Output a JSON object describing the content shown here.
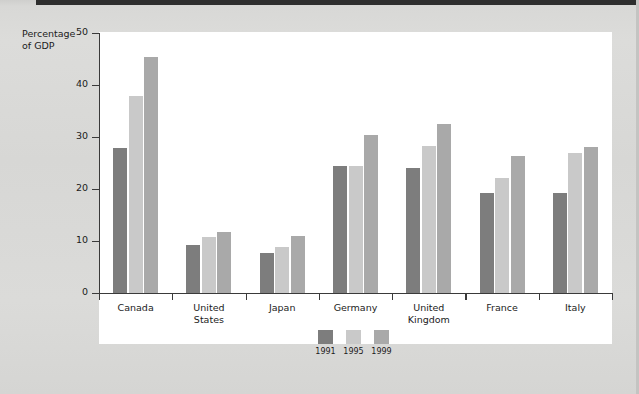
{
  "axis": {
    "y_label_line1": "Percentage",
    "y_label_line2": "of GDP",
    "y_ticks": [
      "50",
      "40",
      "30",
      "20",
      "10",
      "0"
    ]
  },
  "legend": {
    "items": [
      {
        "label": "1991",
        "color": "#7d7d7d"
      },
      {
        "label": "1995",
        "color": "#c9c9c9"
      },
      {
        "label": "1999",
        "color": "#a9a9a9"
      }
    ]
  },
  "categories_display": [
    {
      "line1": "Canada",
      "line2": ""
    },
    {
      "line1": "United",
      "line2": "States"
    },
    {
      "line1": "Japan",
      "line2": ""
    },
    {
      "line1": "Germany",
      "line2": ""
    },
    {
      "line1": "United",
      "line2": "Kingdom"
    },
    {
      "line1": "France",
      "line2": ""
    },
    {
      "line1": "Italy",
      "line2": ""
    }
  ],
  "chart_data": {
    "type": "bar",
    "title": "",
    "xlabel": "",
    "ylabel": "Percentage of GDP",
    "ylim": [
      0,
      50
    ],
    "ytick_step": 10,
    "grid": false,
    "legend_position": "bottom-center",
    "categories": [
      "Canada",
      "United States",
      "Japan",
      "Germany",
      "United Kingdom",
      "France",
      "Italy"
    ],
    "series": [
      {
        "name": "1991",
        "color": "#7d7d7d",
        "values": [
          27.8,
          9.3,
          7.6,
          24.4,
          24.0,
          19.2,
          19.3
        ]
      },
      {
        "name": "1995",
        "color": "#c9c9c9",
        "values": [
          37.8,
          10.8,
          8.9,
          24.5,
          28.2,
          22.2,
          27.0
        ]
      },
      {
        "name": "1999",
        "color": "#a9a9a9",
        "values": [
          45.4,
          11.7,
          11.0,
          30.3,
          32.5,
          26.3,
          28.0
        ]
      }
    ]
  }
}
